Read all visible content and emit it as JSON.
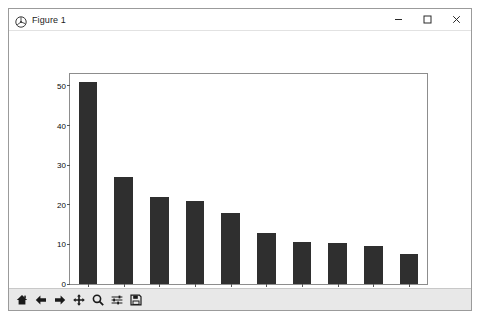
{
  "window": {
    "title": "Figure 1",
    "app_icon": "matplotlib-logo-icon",
    "controls": {
      "minimize": "minimize-button",
      "maximize": "maximize-button",
      "close": "close-button"
    }
  },
  "toolbar": {
    "buttons": [
      {
        "name": "home-icon",
        "tooltip": "Home"
      },
      {
        "name": "back-arrow-icon",
        "tooltip": "Back"
      },
      {
        "name": "forward-arrow-icon",
        "tooltip": "Forward"
      },
      {
        "name": "pan-move-icon",
        "tooltip": "Pan"
      },
      {
        "name": "zoom-magnifier-icon",
        "tooltip": "Zoom"
      },
      {
        "name": "configure-subplots-icon",
        "tooltip": "Configure subplots"
      },
      {
        "name": "save-floppy-icon",
        "tooltip": "Save"
      }
    ]
  },
  "chart_data": {
    "type": "bar",
    "title": "",
    "xlabel": "",
    "ylabel": "",
    "ylim": [
      0,
      53
    ],
    "yticks": [
      0,
      10,
      20,
      30,
      40,
      50
    ],
    "grid": false,
    "bar_color": "#2f2f2f",
    "categories": [
      "mmercial",
      "Noise",
      "idewalk",
      "riveway",
      "Parking",
      "mplaint",
      "Rodent",
      "ondition",
      "System",
      "Vehicle"
    ],
    "values": [
      51,
      27,
      22,
      21,
      18,
      13,
      10.5,
      10.3,
      9.7,
      7.5
    ]
  }
}
